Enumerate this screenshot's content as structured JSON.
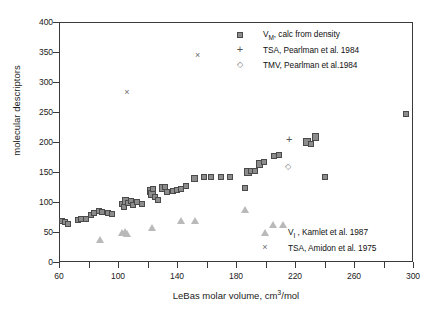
{
  "axes": {
    "ylabel": "molecular descriptors",
    "xlabel_main": "LeBas molar volume, cm",
    "xlabel_sup": "3",
    "xlabel_tail": "/mol",
    "yticks": [
      "0",
      "50",
      "100",
      "150",
      "200",
      "250",
      "300",
      "350",
      "400"
    ],
    "xticks": [
      "60",
      "100",
      "140",
      "180",
      "220",
      "260",
      "300"
    ],
    "xtick_minor": [
      "80",
      "120",
      "160",
      "200",
      "240",
      "280"
    ]
  },
  "legend_top": [
    {
      "marker": "square-marker",
      "label_pre": "V",
      "label_sub": "M",
      "label_post": ", calc from density"
    },
    {
      "marker": "plus-marker",
      "label_pre": "TSA, Pearlman et al. 1984",
      "label_sub": "",
      "label_post": ""
    },
    {
      "marker": "diamond-marker",
      "label_pre": "TMV, Pearlman et al.1984",
      "label_sub": "",
      "label_post": ""
    }
  ],
  "legend_bottom": [
    {
      "marker": "triangle-marker",
      "label_pre": "V",
      "label_sub": "I",
      "label_post": " , Kamlet et al. 1987"
    },
    {
      "marker": "cross-marker",
      "label_pre": "TSA, Amidon et al. 1975",
      "label_sub": "",
      "label_post": ""
    }
  ],
  "chart_data": {
    "type": "scatter",
    "title": "",
    "xlabel": "LeBas molar volume, cm3/mol",
    "ylabel": "molecular descriptors",
    "xlim": [
      60,
      300
    ],
    "ylim": [
      0,
      400
    ],
    "xticks": [
      60,
      80,
      100,
      120,
      140,
      160,
      180,
      200,
      220,
      240,
      260,
      280,
      300
    ],
    "xtick_labels": [
      60,
      100,
      140,
      180,
      220,
      260,
      300
    ],
    "yticks": [
      0,
      50,
      100,
      150,
      200,
      250,
      300,
      350,
      400
    ],
    "grid": false,
    "legend_position": "top-right and bottom-right inside axes",
    "series": [
      {
        "name": "VM, calc from density",
        "marker": "filled square",
        "points": [
          [
            62,
            69
          ],
          [
            64,
            66
          ],
          [
            66,
            64
          ],
          [
            73,
            70
          ],
          [
            75,
            71
          ],
          [
            78,
            72
          ],
          [
            82,
            79
          ],
          [
            84,
            81
          ],
          [
            87,
            85
          ],
          [
            89,
            83
          ],
          [
            93,
            82
          ],
          [
            96,
            80
          ],
          [
            103,
            96
          ],
          [
            104,
            92
          ],
          [
            105,
            102
          ],
          [
            107,
            99
          ],
          [
            109,
            101
          ],
          [
            110,
            95
          ],
          [
            113,
            100
          ],
          [
            116,
            97
          ],
          [
            122,
            118
          ],
          [
            123,
            113
          ],
          [
            124,
            121
          ],
          [
            125,
            108
          ],
          [
            127,
            104
          ],
          [
            130,
            123
          ],
          [
            132,
            125
          ],
          [
            133,
            116
          ],
          [
            137,
            119
          ],
          [
            140,
            120
          ],
          [
            143,
            122
          ],
          [
            146,
            127
          ],
          [
            152,
            139
          ],
          [
            158,
            141
          ],
          [
            163,
            141
          ],
          [
            170,
            142
          ],
          [
            176,
            142
          ],
          [
            186,
            123
          ],
          [
            188,
            150
          ],
          [
            190,
            152
          ],
          [
            193,
            151
          ],
          [
            196,
            163
          ],
          [
            199,
            167
          ],
          [
            206,
            176
          ],
          [
            209,
            179
          ],
          [
            228,
            200
          ],
          [
            231,
            196
          ],
          [
            234,
            208
          ],
          [
            240,
            142
          ],
          [
            295,
            247
          ]
        ]
      },
      {
        "name": "TSA, Pearlman et al. 1984",
        "marker": "plus",
        "points": [
          [
            216,
            205
          ]
        ]
      },
      {
        "name": "TMV, Pearlman et al.1984",
        "marker": "open diamond",
        "points": [
          [
            215,
            160
          ]
        ]
      },
      {
        "name": "VI, Kamlet et al. 1987",
        "marker": "open triangle",
        "points": [
          [
            88,
            37
          ],
          [
            103,
            50
          ],
          [
            105,
            51
          ],
          [
            106,
            48
          ],
          [
            123,
            57
          ],
          [
            143,
            70
          ],
          [
            152,
            70
          ],
          [
            186,
            87
          ],
          [
            205,
            62
          ],
          [
            212,
            62
          ]
        ]
      },
      {
        "name": "TSA, Amidon et al. 1975",
        "marker": "cross",
        "points": [
          [
            106,
            282
          ],
          [
            154,
            345
          ]
        ]
      }
    ]
  }
}
